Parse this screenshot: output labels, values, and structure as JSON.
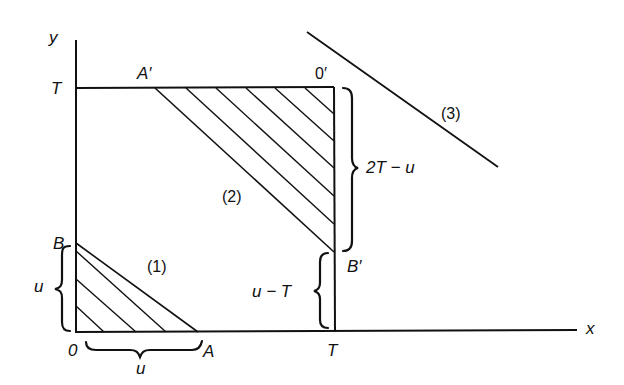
{
  "figure": {
    "axes": {
      "x_label": "x",
      "y_label": "y"
    },
    "points": {
      "origin": "0",
      "O_prime": "0′",
      "A": "A",
      "A_prime": "A′",
      "B": "B",
      "B_prime": "B′",
      "T_x": "T",
      "T_y": "T"
    },
    "regions": {
      "r1": "(1)",
      "r2": "(2)",
      "r3": "(3)"
    },
    "braces": {
      "OA": "u",
      "OB": "u",
      "TB_prime": "u − T",
      "B_prime_O_prime": "2T − u"
    },
    "colors": {
      "ink": "#111111",
      "background": "#ffffff"
    }
  }
}
